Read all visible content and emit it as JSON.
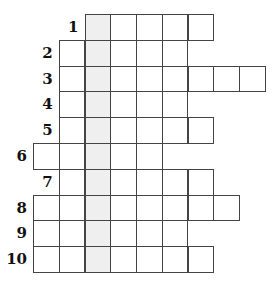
{
  "puzzle": {
    "type": "crossword",
    "shaded_column": 2,
    "shaded_color": "#efefef",
    "border_color": "#444444",
    "rows": [
      {
        "number": "1",
        "start_col": 2,
        "length": 5
      },
      {
        "number": "2",
        "start_col": 1,
        "length": 5
      },
      {
        "number": "3",
        "start_col": 1,
        "length": 8
      },
      {
        "number": "4",
        "start_col": 1,
        "length": 5
      },
      {
        "number": "5",
        "start_col": 1,
        "length": 6
      },
      {
        "number": "6",
        "start_col": 0,
        "length": 5
      },
      {
        "number": "7",
        "start_col": 1,
        "length": 6
      },
      {
        "number": "8",
        "start_col": 0,
        "length": 8
      },
      {
        "number": "9",
        "start_col": 0,
        "length": 6
      },
      {
        "number": "10",
        "start_col": 0,
        "length": 7
      }
    ]
  }
}
